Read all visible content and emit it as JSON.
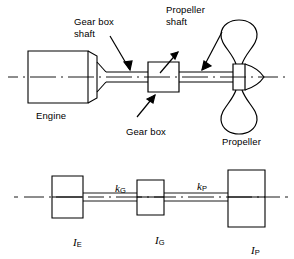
{
  "figure": {
    "stroke_color": "#000000",
    "background_color": "#ffffff",
    "upper_diagram": {
      "name": "physical-layout",
      "components": [
        {
          "id": "engine",
          "label": "Engine",
          "shape": "cylinder-block"
        },
        {
          "id": "gear-box-shaft",
          "label": "Gear box\nshaft",
          "shape": "shaft"
        },
        {
          "id": "gear-box",
          "label": "Gear box",
          "shape": "rectangle"
        },
        {
          "id": "propeller-shaft",
          "label": "Propeller\nshaft",
          "shape": "shaft"
        },
        {
          "id": "propeller",
          "label": "Propeller",
          "shape": "two-blade-propeller"
        }
      ],
      "labels": {
        "engine": "Engine",
        "gear_box_shaft_line1": "Gear box",
        "gear_box_shaft_line2": "shaft",
        "propeller_shaft_line1": "Propeller",
        "propeller_shaft_line2": "shaft",
        "gear_box": "Gear box",
        "propeller": "Propeller"
      }
    },
    "lower_diagram": {
      "name": "equivalent-torsional-model",
      "inertias": [
        {
          "id": "engine-inertia",
          "symbol": "I",
          "subscript": "E"
        },
        {
          "id": "gearbox-inertia",
          "symbol": "I",
          "subscript": "G"
        },
        {
          "id": "propeller-inertia",
          "symbol": "I",
          "subscript": "P"
        }
      ],
      "stiffnesses": [
        {
          "id": "gearbox-shaft-stiffness",
          "symbol": "k",
          "subscript": "G"
        },
        {
          "id": "propeller-shaft-stiffness",
          "symbol": "k",
          "subscript": "P"
        }
      ],
      "labels": {
        "k_G_main": "k",
        "k_G_sub": "G",
        "k_P_main": "k",
        "k_P_sub": "P",
        "I_E_main": "I",
        "I_E_sub": "E",
        "I_G_main": "I",
        "I_G_sub": "G",
        "I_P_main": "I",
        "I_P_sub": "P"
      }
    }
  }
}
